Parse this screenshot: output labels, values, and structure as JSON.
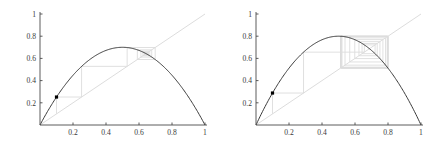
{
  "figure": {
    "type": "cobweb-diagram-pair",
    "background": "#ffffff",
    "width": 437,
    "height": 147
  },
  "chart_data": [
    {
      "type": "line",
      "title": "",
      "subtitle": "",
      "xlabel": "",
      "ylabel": "",
      "panel": "left",
      "xlim": [
        0,
        1
      ],
      "ylim": [
        0,
        1
      ],
      "grid": false,
      "legend": null,
      "xticks": [
        0.2,
        0.4,
        0.6,
        0.8,
        1
      ],
      "xtick_labels": [
        "0.2",
        "0.4",
        "0.6",
        "0.8",
        "1"
      ],
      "yticks": [
        0.2,
        0.4,
        0.6,
        0.8,
        1
      ],
      "ytick_labels": [
        "0.2",
        "0.4",
        "0.6",
        "0.8",
        "1"
      ],
      "series": [
        {
          "name": "logistic-map",
          "kind": "parabola",
          "r": 2.8,
          "peak": [
            0.5,
            0.7
          ],
          "color": "#3a3a3a",
          "width": 1.0
        },
        {
          "name": "identity-diagonal",
          "kind": "line",
          "points": [
            [
              0,
              0
            ],
            [
              1,
              1
            ]
          ],
          "color": "#d8d8d8",
          "width": 0.9
        },
        {
          "name": "cobweb-path",
          "kind": "staircase",
          "color": "#dcdcdc",
          "width": 0.9,
          "x0": 0.1,
          "iterates": [
            0.1,
            0.252,
            0.5282,
            0.6982,
            0.5901,
            0.6772,
            0.6119,
            0.6652,
            0.6237,
            0.657,
            0.6309,
            0.6518,
            0.6353,
            0.6485,
            0.638,
            0.6464,
            0.6397,
            0.6451,
            0.6408,
            0.6442,
            0.6415,
            0.6437,
            0.6419,
            0.6433,
            0.6422,
            0.6431,
            0.6424,
            0.6429
          ]
        }
      ],
      "markers": [
        {
          "name": "initial-point",
          "x": 0.1,
          "y": 0.252,
          "color": "#000000",
          "size": 3.2
        }
      ]
    },
    {
      "type": "line",
      "title": "",
      "subtitle": "",
      "xlabel": "",
      "ylabel": "",
      "panel": "right",
      "xlim": [
        0,
        1
      ],
      "ylim": [
        0,
        1
      ],
      "grid": false,
      "legend": null,
      "xticks": [
        0.2,
        0.4,
        0.6,
        0.8,
        1
      ],
      "xtick_labels": [
        "0.2",
        "0.4",
        "0.6",
        "0.8",
        "1"
      ],
      "yticks": [
        0.2,
        0.4,
        0.6,
        0.8,
        1
      ],
      "ytick_labels": [
        "0.2",
        "0.4",
        "0.6",
        "0.8",
        "1"
      ],
      "series": [
        {
          "name": "logistic-map",
          "kind": "parabola",
          "r": 3.2,
          "peak": [
            0.5,
            0.8
          ],
          "color": "#3a3a3a",
          "width": 1.0
        },
        {
          "name": "identity-diagonal",
          "kind": "line",
          "points": [
            [
              0,
              0
            ],
            [
              1,
              1
            ]
          ],
          "color": "#d8d8d8",
          "width": 0.9
        },
        {
          "name": "cobweb-path",
          "kind": "staircase",
          "color": "#dcdcdc",
          "width": 0.9,
          "x0": 0.1,
          "iterates": [
            0.1,
            0.288,
            0.6565,
            0.7217,
            0.6428,
            0.7346,
            0.6239,
            0.7511,
            0.5985,
            0.7692,
            0.5681,
            0.7853,
            0.5394,
            0.7952,
            0.5212,
            0.7982,
            0.5157,
            0.7987,
            0.5147,
            0.7988,
            0.5145,
            0.7989,
            0.5144,
            0.7989,
            0.5144,
            0.7989,
            0.5144,
            0.7989
          ]
        }
      ],
      "markers": [
        {
          "name": "initial-point",
          "x": 0.1,
          "y": 0.288,
          "color": "#000000",
          "size": 3.2
        }
      ]
    }
  ],
  "axes": {
    "color": "#4a4a4a",
    "tick_color": "#4a4a4a",
    "label_color": "#3a3a3a"
  }
}
